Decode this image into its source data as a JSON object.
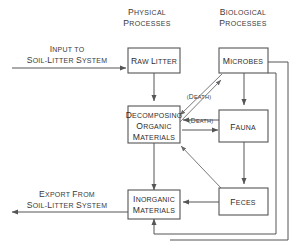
{
  "diagram": {
    "columns": [
      {
        "id": "physical",
        "line1": "Physical",
        "line2": "Processes"
      },
      {
        "id": "biological",
        "line1": "Biological",
        "line2": "Processes"
      }
    ],
    "boxes": [
      {
        "id": "raw-litter",
        "lines": [
          "Raw Litter"
        ]
      },
      {
        "id": "microbes",
        "lines": [
          "Microbes"
        ]
      },
      {
        "id": "decomposing-organic-materials",
        "lines": [
          "Decomposing",
          "Organic",
          "Materials"
        ]
      },
      {
        "id": "fauna",
        "lines": [
          "Fauna"
        ]
      },
      {
        "id": "inorganic-materials",
        "lines": [
          "Inorganic",
          "Materials"
        ]
      },
      {
        "id": "feces",
        "lines": [
          "Feces"
        ]
      }
    ],
    "flow_labels": [
      {
        "id": "input",
        "line1": "Input to",
        "line2": "Soil-Litter System"
      },
      {
        "id": "export",
        "line1": "Export From",
        "line2": "Soil-Litter System"
      }
    ],
    "edge_labels": [
      {
        "id": "death-microbes",
        "text": "(Death)"
      },
      {
        "id": "death-fauna",
        "text": "(Death)"
      }
    ],
    "colors": {
      "background": "#ffffff",
      "stroke": "#555555",
      "text": "#2e2e2e",
      "label_text": "#3a3a3a"
    }
  }
}
